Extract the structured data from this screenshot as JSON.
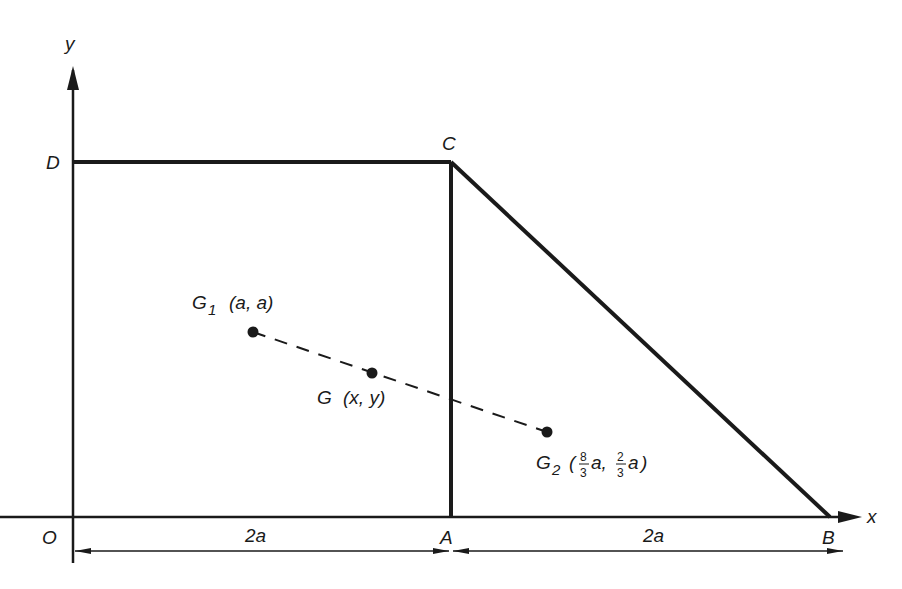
{
  "header_fragment": "g  y",
  "axes": {
    "x_label": "x",
    "y_label": "y",
    "origin_label": "O"
  },
  "vertices": {
    "A": "A",
    "B": "B",
    "C": "C",
    "D": "D"
  },
  "points": {
    "g1": {
      "name": "G",
      "sub": "1",
      "coords": "(a, a)"
    },
    "g": {
      "name": "G",
      "coords": "(x, y)"
    },
    "g2": {
      "name": "G",
      "sub": "2",
      "open": "(",
      "frac1_num": "8",
      "frac1_den": "3",
      "frac1_var": "a,",
      "frac2_num": "2",
      "frac2_den": "3",
      "frac2_var": "a",
      "close": ")"
    }
  },
  "dimensions": {
    "OA": "2a",
    "AB": "2a"
  },
  "colors": {
    "ink": "#1a1a1a",
    "background": "#ffffff"
  }
}
